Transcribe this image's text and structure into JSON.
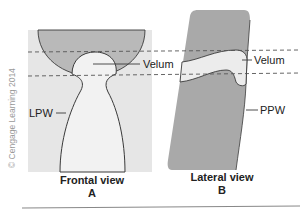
{
  "figure": {
    "copyright": "© Cengage Learning 2014",
    "colors": {
      "frontal_background": "#e6e6e6",
      "frontal_dark_region": "#b9b9b9",
      "opening_fill": "#f2f2f2",
      "lateral_wall": "#a9a9a9",
      "velum_fill": "#ececec",
      "outline": "#3a3a3a",
      "dashed_line": "#555555"
    },
    "panel_a": {
      "title": "Frontal view",
      "letter": "A",
      "labels": {
        "velum": "Velum",
        "lpw": "LPW"
      }
    },
    "panel_b": {
      "title": "Lateral view",
      "letter": "B",
      "labels": {
        "velum": "Velum",
        "ppw": "PPW"
      }
    }
  }
}
